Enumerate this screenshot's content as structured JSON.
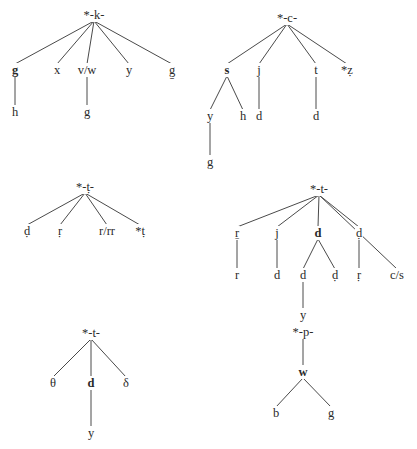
{
  "diagram": {
    "type": "sound-change-trees",
    "trees": [
      {
        "id": "k",
        "root": {
          "label": "*-k-",
          "x": 94,
          "y": 15
        },
        "nodes": [
          {
            "id": "k1",
            "label": "g",
            "x": 15,
            "y": 70,
            "bold": true,
            "parent": "root"
          },
          {
            "id": "k2",
            "label": "x",
            "x": 57,
            "y": 70,
            "parent": "root"
          },
          {
            "id": "k3",
            "label": "v/w",
            "x": 87,
            "y": 70,
            "parent": "root"
          },
          {
            "id": "k4",
            "label": "y",
            "x": 129,
            "y": 70,
            "parent": "root"
          },
          {
            "id": "k5",
            "label": "g̱",
            "x": 172,
            "y": 70,
            "parent": "root"
          },
          {
            "id": "k6",
            "label": "h",
            "x": 15,
            "y": 112,
            "parent": "k1"
          },
          {
            "id": "k7",
            "label": "g",
            "x": 87,
            "y": 112,
            "parent": "k3"
          }
        ]
      },
      {
        "id": "c",
        "root": {
          "label": "*-c-",
          "x": 287,
          "y": 18
        },
        "nodes": [
          {
            "id": "c1",
            "label": "s",
            "x": 227,
            "y": 70,
            "bold": true,
            "parent": "root"
          },
          {
            "id": "c2",
            "label": "j",
            "x": 259,
            "y": 70,
            "parent": "root"
          },
          {
            "id": "c3",
            "label": "t",
            "x": 316,
            "y": 70,
            "parent": "root"
          },
          {
            "id": "c4",
            "label": "*ẓ",
            "x": 347,
            "y": 70,
            "parent": "root"
          },
          {
            "id": "c5",
            "label": "y",
            "x": 210,
            "y": 116,
            "parent": "c1"
          },
          {
            "id": "c6",
            "label": "h",
            "x": 243,
            "y": 116,
            "parent": "c1"
          },
          {
            "id": "c7",
            "label": "d",
            "x": 259,
            "y": 116,
            "parent": "c2"
          },
          {
            "id": "c8",
            "label": "d",
            "x": 316,
            "y": 116,
            "parent": "c3"
          },
          {
            "id": "c9",
            "label": "g",
            "x": 210,
            "y": 162,
            "parent": "c5"
          }
        ]
      },
      {
        "id": "t1",
        "root": {
          "label": "*-ṭ-",
          "x": 85,
          "y": 187
        },
        "nodes": [
          {
            "id": "a1",
            "label": "ḍ",
            "x": 27,
            "y": 231,
            "parent": "root"
          },
          {
            "id": "a2",
            "label": "ṛ",
            "x": 60,
            "y": 231,
            "parent": "root"
          },
          {
            "id": "a3",
            "label": "r/rr",
            "x": 107,
            "y": 231,
            "parent": "root"
          },
          {
            "id": "a4",
            "label": "*ṭ",
            "x": 140,
            "y": 231,
            "parent": "root"
          }
        ]
      },
      {
        "id": "t2",
        "root": {
          "label": "*-t-",
          "x": 319,
          "y": 189
        },
        "nodes": [
          {
            "id": "b1",
            "label": "ṟ",
            "x": 237,
            "y": 233,
            "parent": "root"
          },
          {
            "id": "b2",
            "label": "j",
            "x": 277,
            "y": 233,
            "parent": "root"
          },
          {
            "id": "b3",
            "label": "d",
            "x": 318,
            "y": 233,
            "bold": true,
            "parent": "root"
          },
          {
            "id": "b4",
            "label": "ḍ",
            "x": 359,
            "y": 233,
            "parent": "root"
          },
          {
            "id": "b5",
            "label": "c/s",
            "x": 397,
            "y": 275,
            "parent": "root"
          },
          {
            "id": "b6",
            "label": "r",
            "x": 237,
            "y": 275,
            "parent": "b1"
          },
          {
            "id": "b7",
            "label": "d",
            "x": 277,
            "y": 275,
            "parent": "b2"
          },
          {
            "id": "b8",
            "label": "d",
            "x": 303,
            "y": 275,
            "parent": "b3"
          },
          {
            "id": "b9",
            "label": "ḍ",
            "x": 335,
            "y": 275,
            "parent": "b3"
          },
          {
            "id": "b10",
            "label": "ṛ",
            "x": 359,
            "y": 275,
            "parent": "b4"
          },
          {
            "id": "b11",
            "label": "y",
            "x": 303,
            "y": 315,
            "parent": "b8"
          }
        ]
      },
      {
        "id": "t3",
        "root": {
          "label": "*-t-",
          "x": 91,
          "y": 333
        },
        "nodes": [
          {
            "id": "e1",
            "label": "θ",
            "x": 53,
            "y": 383,
            "parent": "root"
          },
          {
            "id": "e2",
            "label": "d",
            "x": 91,
            "y": 383,
            "bold": true,
            "parent": "root"
          },
          {
            "id": "e3",
            "label": "δ",
            "x": 126,
            "y": 383,
            "parent": "root"
          },
          {
            "id": "e4",
            "label": "y",
            "x": 91,
            "y": 433,
            "parent": "e2"
          }
        ]
      },
      {
        "id": "p",
        "root": {
          "label": "*-p-",
          "x": 303,
          "y": 332
        },
        "nodes": [
          {
            "id": "p1",
            "label": "w",
            "x": 303,
            "y": 372,
            "bold": true,
            "parent": "root"
          },
          {
            "id": "p2",
            "label": "b",
            "x": 276,
            "y": 413,
            "parent": "p1"
          },
          {
            "id": "p3",
            "label": "g",
            "x": 331,
            "y": 413,
            "parent": "p1"
          }
        ]
      }
    ]
  }
}
